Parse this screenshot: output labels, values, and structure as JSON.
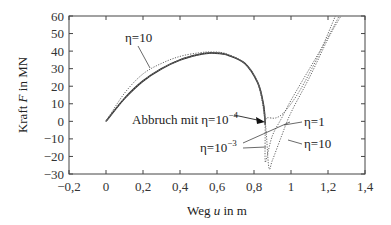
{
  "chart_data": {
    "type": "line",
    "title": "",
    "xlabel": "Weg u in m",
    "ylabel": "Kraft F in MN",
    "xlim": [
      -0.2,
      1.4
    ],
    "ylim": [
      -30,
      60
    ],
    "xticks": [
      "−0,2",
      "0",
      "0,2",
      "0,4",
      "0,6",
      "0,8",
      "1",
      "1,2",
      "1,4"
    ],
    "yticks": [
      "60",
      "50",
      "40",
      "30",
      "20",
      "10",
      "0",
      "−10",
      "−20",
      "−30"
    ],
    "grid": false,
    "series": [
      {
        "name": "Abbruch mit η=10⁻⁴",
        "style": "solid",
        "x": [
          0,
          0.1,
          0.2,
          0.3,
          0.4,
          0.5,
          0.57,
          0.65,
          0.75,
          0.82,
          0.85,
          0.86,
          0.86
        ],
        "y": [
          0,
          13,
          23,
          30,
          35,
          38,
          39,
          38,
          33,
          22,
          10,
          0,
          -2
        ]
      },
      {
        "name": "η=10⁻³",
        "style": "dotted",
        "x": [
          0,
          0.1,
          0.2,
          0.3,
          0.4,
          0.5,
          0.57,
          0.65,
          0.75,
          0.82,
          0.85,
          0.86,
          0.86,
          0.87,
          0.9,
          0.95,
          1.0,
          1.1,
          1.2,
          1.26
        ],
        "y": [
          0,
          13,
          23,
          30,
          35,
          38,
          39,
          38,
          33,
          22,
          10,
          0,
          -22,
          -20,
          -8,
          2,
          12,
          30,
          48,
          60
        ]
      },
      {
        "name": "η=1",
        "style": "dotted",
        "x": [
          0,
          0.1,
          0.2,
          0.3,
          0.4,
          0.5,
          0.57,
          0.65,
          0.75,
          0.82,
          0.85,
          0.86,
          0.87,
          0.92,
          0.97,
          1.05,
          1.15,
          1.24
        ],
        "y": [
          0,
          13,
          23,
          30,
          35,
          38,
          39,
          38,
          33,
          22,
          10,
          0,
          2,
          2,
          6,
          18,
          38,
          60
        ]
      },
      {
        "name": "η=10",
        "style": "dotted",
        "x": [
          0,
          0.1,
          0.2,
          0.3,
          0.4,
          0.5,
          0.57,
          0.65,
          0.75,
          0.82,
          0.86,
          0.88,
          0.9,
          0.95,
          1.0,
          1.1,
          1.2,
          1.27
        ],
        "y": [
          0,
          16,
          27,
          33,
          37,
          39,
          39.5,
          38.5,
          33,
          22,
          0,
          -26,
          -22,
          -8,
          5,
          25,
          47,
          60
        ]
      }
    ],
    "annotations": [
      {
        "text": "η=10",
        "x": 0.03,
        "y": 52
      },
      {
        "text": "Abbruch mit η=10⁻⁴",
        "x": 0.1,
        "y": 8
      },
      {
        "text": "η=10⁻³",
        "x": 0.48,
        "y": -10
      },
      {
        "text": "η=1",
        "x": 1.08,
        "y": 2
      },
      {
        "text": "η=10",
        "x": 1.05,
        "y": -10
      }
    ]
  },
  "labels": {
    "xlabel": "Weg u in m",
    "ylabel_prefix": "Kraft ",
    "ylabel_var": "F",
    "ylabel_suffix": " in MN",
    "xlabel_prefix": "Weg ",
    "xlabel_var": "u",
    "xlabel_suffix": " in m",
    "ann_eta10_top": "η=10",
    "ann_abbruch": "Abbruch mit η=10",
    "ann_abbruch_exp": "−4",
    "ann_eta1e3": "η=10",
    "ann_eta1e3_exp": "−3",
    "ann_eta1": "η=1",
    "ann_eta10_bottom": "η=10"
  }
}
